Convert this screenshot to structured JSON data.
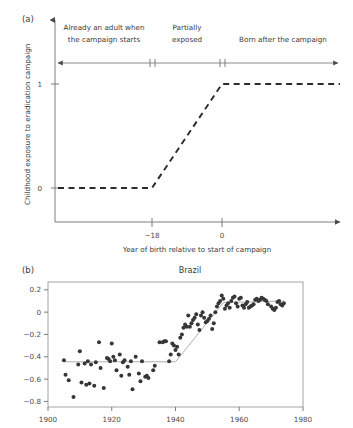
{
  "figure": {
    "panels": [
      {
        "label": "(a)",
        "type": "schematic-step",
        "yaxis_title": "Childhood exposure to eradication campaign",
        "xaxis_title": "Year of birth relative to start of campaign",
        "y_ticks": [
          "0",
          "1"
        ],
        "x_ticks": [
          "−18",
          "0"
        ],
        "regions": [
          {
            "line1": "Already an adult when",
            "line2": "the campaign starts"
          },
          {
            "line1": "Partially",
            "line2": "exposed"
          },
          {
            "line1": "Born after the campaign",
            "line2": ""
          }
        ]
      },
      {
        "label": "(b)",
        "title": "Brazil",
        "type": "scatter"
      }
    ]
  },
  "chart_data": [
    {
      "type": "line",
      "title": "",
      "subtitle": "(a)",
      "xlabel": "Year of birth relative to start of campaign",
      "ylabel": "Childhood exposure to eradication campaign",
      "xlim": [
        -45,
        40
      ],
      "ylim": [
        -0.18,
        1.35
      ],
      "x_ticks": [
        -18,
        0
      ],
      "x_tick_labels": [
        "−18",
        "0"
      ],
      "y_ticks": [
        0,
        1
      ],
      "y_tick_labels": [
        "0",
        "1"
      ],
      "grid": false,
      "legend": "none",
      "linestyle": "dashed",
      "x": [
        -45,
        -18,
        0,
        40
      ],
      "values": [
        0,
        0,
        1,
        1
      ],
      "annotations": [
        {
          "text": "Already an adult when the campaign starts",
          "x_range": [
            -45,
            -18
          ]
        },
        {
          "text": "Partially exposed",
          "x_range": [
            -18,
            0
          ]
        },
        {
          "text": "Born after the campaign",
          "x_range": [
            0,
            40
          ]
        }
      ]
    },
    {
      "type": "scatter",
      "title": "Brazil",
      "subtitle": "(b)",
      "xlabel": "",
      "ylabel": "",
      "xlim": [
        1900,
        1980
      ],
      "ylim": [
        -0.85,
        0.27
      ],
      "x_ticks": [
        1900,
        1920,
        1940,
        1960,
        1980
      ],
      "x_tick_labels": [
        "1900",
        "1920",
        "1940",
        "1960",
        "1980"
      ],
      "y_ticks": [
        0.2,
        0,
        -0.2,
        -0.4,
        -0.6,
        -0.8
      ],
      "y_tick_labels": [
        "0.2",
        "0",
        "−0.2",
        "−0.4",
        "−0.6",
        "−0.8"
      ],
      "grid": false,
      "legend": "none",
      "marker_color": "#363636",
      "points": [
        [
          1905.0,
          -0.43
        ],
        [
          1905.5,
          -0.56
        ],
        [
          1906.5,
          -0.61
        ],
        [
          1908.0,
          -0.76
        ],
        [
          1909.5,
          -0.47
        ],
        [
          1910.0,
          -0.35
        ],
        [
          1910.5,
          -0.63
        ],
        [
          1911.5,
          -0.46
        ],
        [
          1912.0,
          -0.65
        ],
        [
          1912.5,
          -0.44
        ],
        [
          1913.0,
          -0.64
        ],
        [
          1913.5,
          -0.47
        ],
        [
          1914.5,
          -0.66
        ],
        [
          1915.0,
          -0.45
        ],
        [
          1916.0,
          -0.27
        ],
        [
          1916.5,
          -0.5
        ],
        [
          1917.5,
          -0.68
        ],
        [
          1918.5,
          -0.41
        ],
        [
          1919.0,
          -0.42
        ],
        [
          1919.5,
          -0.44
        ],
        [
          1920.0,
          -0.28
        ],
        [
          1920.5,
          -0.4
        ],
        [
          1921.0,
          -0.43
        ],
        [
          1921.5,
          -0.52
        ],
        [
          1922.5,
          -0.38
        ],
        [
          1923.0,
          -0.57
        ],
        [
          1923.5,
          -0.45
        ],
        [
          1924.0,
          -0.43
        ],
        [
          1925.0,
          -0.49
        ],
        [
          1925.5,
          -0.56
        ],
        [
          1926.0,
          -0.44
        ],
        [
          1926.5,
          -0.69
        ],
        [
          1927.5,
          -0.4
        ],
        [
          1928.5,
          -0.55
        ],
        [
          1929.0,
          -0.62
        ],
        [
          1929.5,
          -0.44
        ],
        [
          1930.5,
          -0.58
        ],
        [
          1931.0,
          -0.57
        ],
        [
          1931.5,
          -0.59
        ],
        [
          1933.0,
          -0.52
        ],
        [
          1933.5,
          -0.48
        ],
        [
          1935.0,
          -0.27
        ],
        [
          1936.0,
          -0.27
        ],
        [
          1936.5,
          -0.26
        ],
        [
          1937.0,
          -0.26
        ],
        [
          1938.0,
          -0.44
        ],
        [
          1938.5,
          -0.38
        ],
        [
          1939.0,
          -0.28
        ],
        [
          1939.5,
          -0.3
        ],
        [
          1940.0,
          -0.34
        ],
        [
          1940.5,
          -0.31
        ],
        [
          1941.0,
          -0.38
        ],
        [
          1941.5,
          -0.23
        ],
        [
          1942.0,
          -0.2
        ],
        [
          1942.5,
          -0.14
        ],
        [
          1943.0,
          -0.11
        ],
        [
          1943.5,
          -0.13
        ],
        [
          1944.0,
          -0.03
        ],
        [
          1944.5,
          -0.13
        ],
        [
          1945.0,
          -0.1
        ],
        [
          1945.5,
          -0.07
        ],
        [
          1946.0,
          -0.05
        ],
        [
          1946.5,
          -0.02
        ],
        [
          1947.0,
          -0.11
        ],
        [
          1947.5,
          -0.16
        ],
        [
          1948.0,
          -0.03
        ],
        [
          1948.5,
          0.0
        ],
        [
          1949.0,
          -0.05
        ],
        [
          1949.5,
          -0.09
        ],
        [
          1950.0,
          -0.08
        ],
        [
          1950.5,
          -0.06
        ],
        [
          1951.0,
          -0.03
        ],
        [
          1951.5,
          -0.15
        ],
        [
          1952.0,
          -0.1
        ],
        [
          1952.5,
          0.0
        ],
        [
          1953.0,
          0.05
        ],
        [
          1953.5,
          0.08
        ],
        [
          1954.0,
          0.1
        ],
        [
          1954.5,
          0.15
        ],
        [
          1955.0,
          0.12
        ],
        [
          1955.5,
          0.03
        ],
        [
          1956.0,
          0.06
        ],
        [
          1956.5,
          0.08
        ],
        [
          1957.0,
          0.04
        ],
        [
          1957.5,
          0.1
        ],
        [
          1958.0,
          0.13
        ],
        [
          1958.5,
          0.14
        ],
        [
          1959.0,
          0.08
        ],
        [
          1959.5,
          0.05
        ],
        [
          1960.0,
          0.12
        ],
        [
          1960.5,
          0.13
        ],
        [
          1961.0,
          0.06
        ],
        [
          1961.5,
          0.04
        ],
        [
          1962.0,
          0.07
        ],
        [
          1962.5,
          0.09
        ],
        [
          1963.0,
          0.04
        ],
        [
          1963.5,
          0.05
        ],
        [
          1964.0,
          0.06
        ],
        [
          1964.5,
          0.07
        ],
        [
          1965.0,
          0.11
        ],
        [
          1965.5,
          0.12
        ],
        [
          1966.0,
          0.1
        ],
        [
          1966.5,
          0.11
        ],
        [
          1967.0,
          0.13
        ],
        [
          1967.5,
          0.12
        ],
        [
          1968.0,
          0.11
        ],
        [
          1968.5,
          0.1
        ],
        [
          1969.0,
          0.07
        ],
        [
          1970.0,
          0.05
        ],
        [
          1970.5,
          0.03
        ],
        [
          1971.0,
          0.02
        ],
        [
          1971.5,
          0.04
        ],
        [
          1972.0,
          0.09
        ],
        [
          1972.5,
          0.1
        ],
        [
          1973.0,
          0.07
        ],
        [
          1973.5,
          0.06
        ],
        [
          1974.0,
          0.08
        ]
      ],
      "fit_line": {
        "x": [
          1905,
          1940,
          1955,
          1974
        ],
        "y": [
          -0.445,
          -0.445,
          0.085,
          0.1
        ],
        "color": "#9a9a9a"
      }
    }
  ]
}
